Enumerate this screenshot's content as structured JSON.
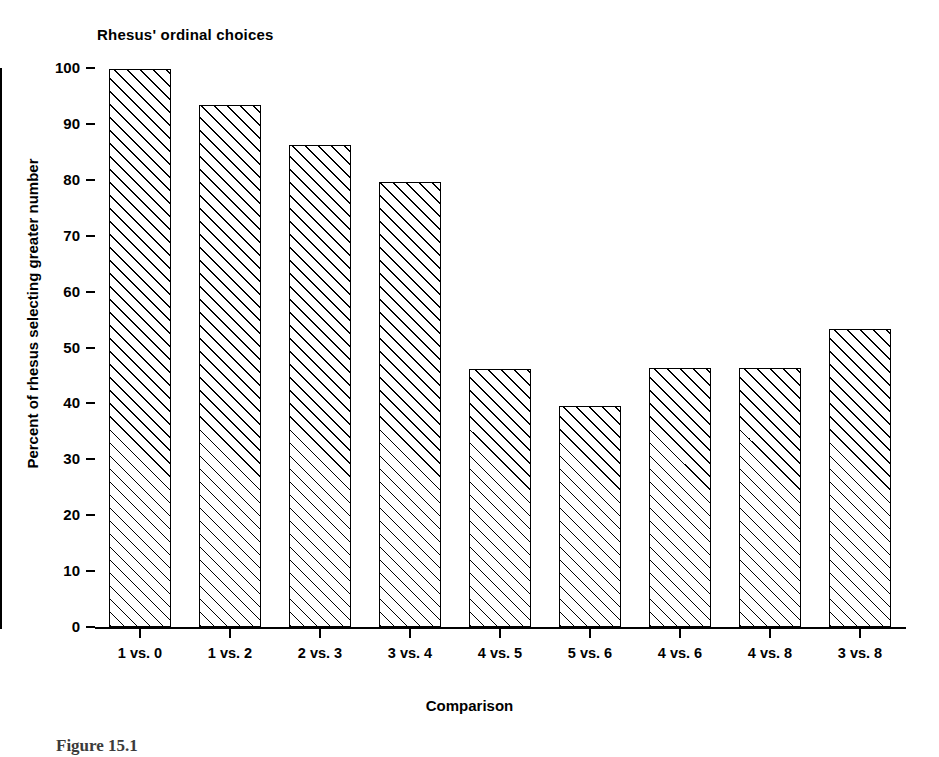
{
  "figure": {
    "caption": "Figure 15.1"
  },
  "chart_data": {
    "type": "bar",
    "title": "Rhesus' ordinal choices",
    "xlabel": "Comparison",
    "ylabel": "Percent of rhesus selecting greater number",
    "categories": [
      "1 vs. 0",
      "1 vs. 2",
      "2 vs. 3",
      "3 vs. 4",
      "4 vs. 5",
      "5 vs. 6",
      "4 vs. 6",
      "4 vs. 8",
      "3 vs. 8"
    ],
    "values": [
      99.8,
      93.3,
      86.2,
      79.6,
      46.2,
      39.6,
      46.3,
      46.4,
      53.3
    ],
    "ylim": [
      0,
      100
    ],
    "yticks": [
      0,
      10,
      20,
      30,
      40,
      50,
      60,
      70,
      80,
      90,
      100
    ],
    "ytick_labels": [
      "0",
      "10",
      "20",
      "30",
      "40",
      "50",
      "60",
      "70",
      "80",
      "90",
      "100"
    ],
    "grid": false,
    "legend": null,
    "bar_style": {
      "fill": "#ffffff",
      "edge": "#000000",
      "hatch": "diagonal-45"
    }
  }
}
